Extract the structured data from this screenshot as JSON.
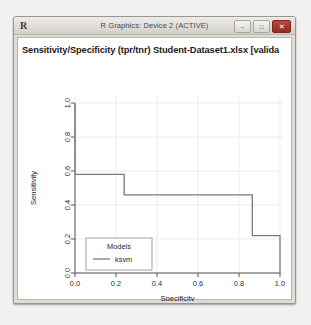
{
  "window": {
    "app_mark": "R",
    "title": "R Graphics: Device 2 (ACTIVE)",
    "buttons": {
      "minimize": "–",
      "maximize": "□",
      "close": "✕"
    }
  },
  "chart_data": {
    "type": "line",
    "title": "Sensitivity/Specificity (tpr/tnr)  Student-Dataset1.xlsx [valida",
    "xlabel": "Specificity",
    "ylabel": "Sensitivity",
    "subtitle": "Rattle 2015-Dec-21 06:27:00 mca",
    "xlim": [
      0.0,
      1.0
    ],
    "ylim": [
      0.0,
      1.0
    ],
    "xticks": [
      "0.0",
      "0.2",
      "0.4",
      "0.6",
      "0.8",
      "1.0"
    ],
    "yticks": [
      "0.0",
      "0.2",
      "0.4",
      "0.6",
      "0.8",
      "1.0"
    ],
    "xtick_values": [
      0.0,
      0.2,
      0.4,
      0.6,
      0.8,
      1.0
    ],
    "ytick_values": [
      0.0,
      0.2,
      0.4,
      0.6,
      0.8,
      1.0
    ],
    "grid": true,
    "legend": {
      "title": "Models",
      "position": "bottom-left",
      "entries": [
        {
          "label": "ksvm",
          "color": "#6f6f6f",
          "style": "solid"
        }
      ]
    },
    "series": [
      {
        "name": "ksvm",
        "color": "#6f6f6f",
        "style": "step",
        "x": [
          0.0,
          0.0,
          0.24,
          0.24,
          0.865,
          0.865,
          1.0,
          1.0
        ],
        "y": [
          1.0,
          0.58,
          0.58,
          0.46,
          0.46,
          0.22,
          0.22,
          0.0
        ],
        "dotted_segments": [
          {
            "x": [
              0.0,
              0.0
            ],
            "y": [
              1.0,
              0.58
            ]
          },
          {
            "x": [
              1.0,
              1.0
            ],
            "y": [
              0.22,
              0.0
            ]
          }
        ]
      }
    ]
  }
}
